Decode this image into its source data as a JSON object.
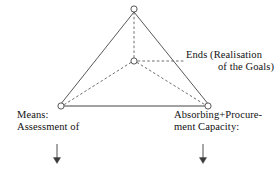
{
  "diagram": {
    "type": "triangle-relationship-diagram",
    "background_color": "#ffffff",
    "stroke_color": "#3a3a3a",
    "node_fill_color": "#ffffff",
    "nodes": [
      {
        "id": "apex",
        "name": "apex-node",
        "x": 134,
        "y": 9,
        "r": 3.2
      },
      {
        "id": "center",
        "name": "center-node",
        "x": 134,
        "y": 61,
        "r": 3.2
      },
      {
        "id": "bottom-left",
        "name": "bottom-left-node",
        "x": 61,
        "y": 106,
        "r": 3.2
      },
      {
        "id": "bottom-right",
        "name": "bottom-right-node",
        "x": 208,
        "y": 106,
        "r": 3.2
      }
    ],
    "solid_edges": [
      {
        "name": "edge-apex-to-bottom-left",
        "x1": 134,
        "y1": 12,
        "x2": 61,
        "y2": 103
      },
      {
        "name": "edge-apex-to-bottom-right",
        "x1": 134,
        "y1": 12,
        "x2": 208,
        "y2": 103
      },
      {
        "name": "edge-bottom-left-to-bottom-right",
        "x1": 64,
        "y1": 106,
        "x2": 205,
        "y2": 106
      }
    ],
    "dashed_edges": [
      {
        "name": "dashed-center-to-apex",
        "x1": 134,
        "y1": 58,
        "x2": 134,
        "y2": 13
      },
      {
        "name": "dashed-center-to-bottom-left",
        "x1": 131,
        "y1": 62,
        "x2": 64,
        "y2": 105
      },
      {
        "name": "dashed-center-to-bottom-right",
        "x1": 137,
        "y1": 62,
        "x2": 205,
        "y2": 105
      },
      {
        "name": "dashed-center-to-ends-label",
        "x1": 138,
        "y1": 61,
        "x2": 184,
        "y2": 61
      }
    ],
    "arrows": [
      {
        "name": "arrow-down-means",
        "x": 57,
        "y_start": 144,
        "y_end": 163
      },
      {
        "name": "arrow-down-capacity",
        "x": 203,
        "y_start": 144,
        "y_end": 163
      }
    ]
  },
  "labels": {
    "ends": {
      "name": "ends-label",
      "line1": "Ends (Realisation",
      "line2": "of the Goals)"
    },
    "means": {
      "name": "means-label",
      "line1": "Means:",
      "line2": "Assessment of"
    },
    "capacity": {
      "name": "capacity-label",
      "line1": "Absorbing+Procure-",
      "line2": "ment Capacity:"
    }
  }
}
